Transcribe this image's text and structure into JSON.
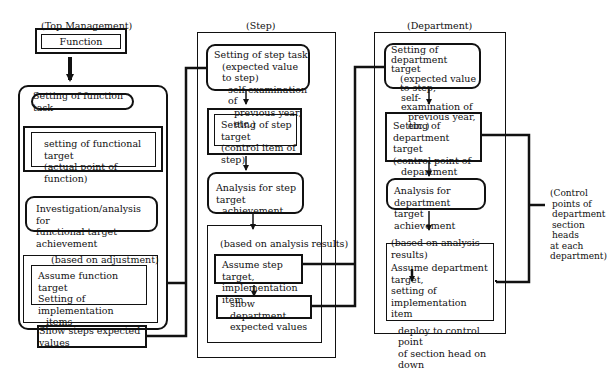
{
  "columns": {
    "top_management": {
      "heading": "(Top Management)",
      "function_box": "Function",
      "steps": {
        "task": "Setting of function task",
        "target_line1": "setting of functional target",
        "target_line2": "(actual point of function)",
        "analysis_line1": "Investigation/analysis for",
        "analysis_line2": "functional target achievement",
        "adjust_heading": "(based on adjustment)",
        "assume_line1": "Assume function target",
        "assume_line2": "Setting of implementation",
        "assume_line3": "items",
        "show": "Show steps expected values"
      }
    },
    "step": {
      "heading": "(Step)",
      "steps": {
        "task_line1": "Setting of step task",
        "task_line2": "(expected value to step)",
        "task_line3": "self-examination of",
        "task_line4": "previous year, etc.)",
        "target_line1": "Setting of step target",
        "target_line2": "(control item of step)",
        "analysis_line1": "Analysis for step target",
        "analysis_line2": "achievement",
        "results_heading": "(based on analysis results)",
        "assume_line1": "Assume step target,",
        "assume_line2": "implementation item",
        "show_line1": "show department",
        "show_line2": "expected values"
      }
    },
    "department": {
      "heading": "(Department)",
      "steps": {
        "task_line1": "Setting of department",
        "task_line2": "target",
        "task_line3": "(expected value to step,",
        "task_line4": "self-examination of",
        "task_line5": "previous year, etc.)",
        "target_line1": "Setting of department",
        "target_line2": "target",
        "target_line3": "(control point of",
        "target_line4": "department head)",
        "analysis_line1": "Analysis for department",
        "analysis_line2": "target achievement",
        "results_heading": "(based on analysis results)",
        "assume_line1": "Assume department target,",
        "assume_line2": "setting of implementation",
        "assume_line3": "item",
        "deploy_line1": "deploy to control point",
        "deploy_line2": "of section head on down"
      }
    }
  },
  "side_note": {
    "line1": "(Control",
    "line2": "points of",
    "line3": "department",
    "line4": "section heads",
    "line5": "at each",
    "line6": "department)"
  }
}
